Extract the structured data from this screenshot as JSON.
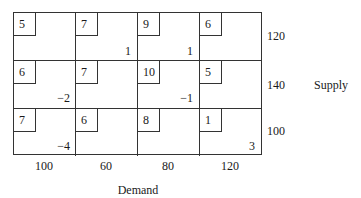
{
  "table": {
    "rows": [
      {
        "cells": [
          {
            "cost": "5",
            "value": ""
          },
          {
            "cost": "7",
            "value": "1"
          },
          {
            "cost": "9",
            "value": "1"
          },
          {
            "cost": "6",
            "value": ""
          }
        ],
        "supply": "120"
      },
      {
        "cells": [
          {
            "cost": "6",
            "value": "−2"
          },
          {
            "cost": "7",
            "value": ""
          },
          {
            "cost": "10",
            "value": "−1"
          },
          {
            "cost": "5",
            "value": ""
          }
        ],
        "supply": "140"
      },
      {
        "cells": [
          {
            "cost": "7",
            "value": "−4"
          },
          {
            "cost": "6",
            "value": ""
          },
          {
            "cost": "8",
            "value": ""
          },
          {
            "cost": "1",
            "value": "3"
          }
        ],
        "supply": "100"
      }
    ],
    "demand": [
      "100",
      "60",
      "80",
      "120"
    ]
  },
  "labels": {
    "supply": "Supply",
    "demand": "Demand"
  }
}
